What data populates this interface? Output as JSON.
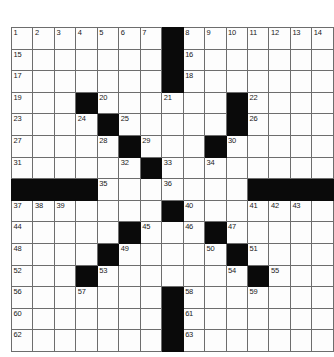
{
  "puzzle": {
    "type": "crossword-grid",
    "rows": 15,
    "cols": 15,
    "cell_fill_color": "#fdfdfd",
    "block_color": "#0a0a0a",
    "grid_line_color": "#6d6d6d",
    "number_color": "#1a1a1a",
    "max_clue_number": 63,
    "grid": [
      [
        {
          "n": "1",
          "b": false
        },
        {
          "n": "2",
          "b": false
        },
        {
          "n": "3",
          "b": false
        },
        {
          "n": "4",
          "b": false
        },
        {
          "n": "5",
          "b": false
        },
        {
          "n": "6",
          "b": false
        },
        {
          "n": "7",
          "b": false
        },
        {
          "n": "",
          "b": true
        },
        {
          "n": "8",
          "b": false
        },
        {
          "n": "9",
          "b": false
        },
        {
          "n": "10",
          "b": false
        },
        {
          "n": "11",
          "b": false
        },
        {
          "n": "12",
          "b": false
        },
        {
          "n": "13",
          "b": false
        },
        {
          "n": "14",
          "b": false
        }
      ],
      [
        {
          "n": "15",
          "b": false
        },
        {
          "n": "",
          "b": false
        },
        {
          "n": "",
          "b": false
        },
        {
          "n": "",
          "b": false
        },
        {
          "n": "",
          "b": false
        },
        {
          "n": "",
          "b": false
        },
        {
          "n": "",
          "b": false
        },
        {
          "n": "",
          "b": true
        },
        {
          "n": "16",
          "b": false
        },
        {
          "n": "",
          "b": false
        },
        {
          "n": "",
          "b": false
        },
        {
          "n": "",
          "b": false
        },
        {
          "n": "",
          "b": false
        },
        {
          "n": "",
          "b": false
        },
        {
          "n": "",
          "b": false
        }
      ],
      [
        {
          "n": "17",
          "b": false
        },
        {
          "n": "",
          "b": false
        },
        {
          "n": "",
          "b": false
        },
        {
          "n": "",
          "b": false
        },
        {
          "n": "",
          "b": false
        },
        {
          "n": "",
          "b": false
        },
        {
          "n": "",
          "b": false
        },
        {
          "n": "",
          "b": true
        },
        {
          "n": "18",
          "b": false
        },
        {
          "n": "",
          "b": false
        },
        {
          "n": "",
          "b": false
        },
        {
          "n": "",
          "b": false
        },
        {
          "n": "",
          "b": false
        },
        {
          "n": "",
          "b": false
        },
        {
          "n": "",
          "b": false
        }
      ],
      [
        {
          "n": "19",
          "b": false
        },
        {
          "n": "",
          "b": false
        },
        {
          "n": "",
          "b": false
        },
        {
          "n": "",
          "b": true
        },
        {
          "n": "20",
          "b": false
        },
        {
          "n": "",
          "b": false
        },
        {
          "n": "",
          "b": false
        },
        {
          "n": "21",
          "b": false
        },
        {
          "n": "",
          "b": false
        },
        {
          "n": "",
          "b": false
        },
        {
          "n": "",
          "b": true
        },
        {
          "n": "22",
          "b": false
        },
        {
          "n": "",
          "b": false
        },
        {
          "n": "",
          "b": false
        },
        {
          "n": "",
          "b": false
        }
      ],
      [
        {
          "n": "23",
          "b": false
        },
        {
          "n": "",
          "b": false
        },
        {
          "n": "",
          "b": false
        },
        {
          "n": "24",
          "b": false
        },
        {
          "n": "",
          "b": true
        },
        {
          "n": "25",
          "b": false
        },
        {
          "n": "",
          "b": false
        },
        {
          "n": "",
          "b": false
        },
        {
          "n": "",
          "b": false
        },
        {
          "n": "",
          "b": false
        },
        {
          "n": "",
          "b": true
        },
        {
          "n": "26",
          "b": false
        },
        {
          "n": "",
          "b": false
        },
        {
          "n": "",
          "b": false
        },
        {
          "n": "",
          "b": false
        }
      ],
      [
        {
          "n": "27",
          "b": false
        },
        {
          "n": "",
          "b": false
        },
        {
          "n": "",
          "b": false
        },
        {
          "n": "",
          "b": false
        },
        {
          "n": "28",
          "b": false
        },
        {
          "n": "",
          "b": true
        },
        {
          "n": "29",
          "b": false
        },
        {
          "n": "",
          "b": false
        },
        {
          "n": "",
          "b": false
        },
        {
          "n": "",
          "b": true
        },
        {
          "n": "30",
          "b": false
        },
        {
          "n": "",
          "b": false
        },
        {
          "n": "",
          "b": false
        },
        {
          "n": "",
          "b": false
        },
        {
          "n": "",
          "b": false
        }
      ],
      [
        {
          "n": "31",
          "b": false
        },
        {
          "n": "",
          "b": false
        },
        {
          "n": "",
          "b": false
        },
        {
          "n": "",
          "b": false
        },
        {
          "n": "",
          "b": false
        },
        {
          "n": "32",
          "b": false
        },
        {
          "n": "",
          "b": true
        },
        {
          "n": "33",
          "b": false
        },
        {
          "n": "",
          "b": false
        },
        {
          "n": "34",
          "b": false
        },
        {
          "n": "",
          "b": false
        },
        {
          "n": "",
          "b": false
        },
        {
          "n": "",
          "b": false
        },
        {
          "n": "",
          "b": false
        },
        {
          "n": "",
          "b": false
        }
      ],
      [
        {
          "n": "",
          "b": true
        },
        {
          "n": "",
          "b": true
        },
        {
          "n": "",
          "b": true
        },
        {
          "n": "",
          "b": true
        },
        {
          "n": "35",
          "b": false
        },
        {
          "n": "",
          "b": false
        },
        {
          "n": "",
          "b": false
        },
        {
          "n": "36",
          "b": false
        },
        {
          "n": "",
          "b": false
        },
        {
          "n": "",
          "b": false
        },
        {
          "n": "",
          "b": false
        },
        {
          "n": "",
          "b": true
        },
        {
          "n": "",
          "b": true
        },
        {
          "n": "",
          "b": true
        },
        {
          "n": "",
          "b": true
        }
      ],
      [
        {
          "n": "37",
          "b": false
        },
        {
          "n": "38",
          "b": false
        },
        {
          "n": "39",
          "b": false
        },
        {
          "n": "",
          "b": false
        },
        {
          "n": "",
          "b": false
        },
        {
          "n": "",
          "b": false
        },
        {
          "n": "",
          "b": false
        },
        {
          "n": "",
          "b": true
        },
        {
          "n": "40",
          "b": false
        },
        {
          "n": "",
          "b": false
        },
        {
          "n": "",
          "b": false
        },
        {
          "n": "41",
          "b": false
        },
        {
          "n": "42",
          "b": false
        },
        {
          "n": "43",
          "b": false
        },
        {
          "n": "",
          "b": false
        }
      ],
      [
        {
          "n": "44",
          "b": false
        },
        {
          "n": "",
          "b": false
        },
        {
          "n": "",
          "b": false
        },
        {
          "n": "",
          "b": false
        },
        {
          "n": "",
          "b": false
        },
        {
          "n": "",
          "b": true
        },
        {
          "n": "45",
          "b": false
        },
        {
          "n": "",
          "b": false
        },
        {
          "n": "46",
          "b": false
        },
        {
          "n": "",
          "b": true
        },
        {
          "n": "47",
          "b": false
        },
        {
          "n": "",
          "b": false
        },
        {
          "n": "",
          "b": false
        },
        {
          "n": "",
          "b": false
        },
        {
          "n": "",
          "b": false
        }
      ],
      [
        {
          "n": "48",
          "b": false
        },
        {
          "n": "",
          "b": false
        },
        {
          "n": "",
          "b": false
        },
        {
          "n": "",
          "b": false
        },
        {
          "n": "",
          "b": true
        },
        {
          "n": "49",
          "b": false
        },
        {
          "n": "",
          "b": false
        },
        {
          "n": "",
          "b": false
        },
        {
          "n": "",
          "b": false
        },
        {
          "n": "50",
          "b": false
        },
        {
          "n": "",
          "b": true
        },
        {
          "n": "51",
          "b": false
        },
        {
          "n": "",
          "b": false
        },
        {
          "n": "",
          "b": false
        },
        {
          "n": "",
          "b": false
        }
      ],
      [
        {
          "n": "52",
          "b": false
        },
        {
          "n": "",
          "b": false
        },
        {
          "n": "",
          "b": false
        },
        {
          "n": "",
          "b": true
        },
        {
          "n": "53",
          "b": false
        },
        {
          "n": "",
          "b": false
        },
        {
          "n": "",
          "b": false
        },
        {
          "n": "",
          "b": false
        },
        {
          "n": "",
          "b": false
        },
        {
          "n": "",
          "b": false
        },
        {
          "n": "54",
          "b": false
        },
        {
          "n": "",
          "b": true
        },
        {
          "n": "55",
          "b": false
        },
        {
          "n": "",
          "b": false
        },
        {
          "n": "",
          "b": false
        }
      ],
      [
        {
          "n": "56",
          "b": false
        },
        {
          "n": "",
          "b": false
        },
        {
          "n": "",
          "b": false
        },
        {
          "n": "57",
          "b": false
        },
        {
          "n": "",
          "b": false
        },
        {
          "n": "",
          "b": false
        },
        {
          "n": "",
          "b": false
        },
        {
          "n": "",
          "b": true
        },
        {
          "n": "58",
          "b": false
        },
        {
          "n": "",
          "b": false
        },
        {
          "n": "",
          "b": false
        },
        {
          "n": "59",
          "b": false
        },
        {
          "n": "",
          "b": false
        },
        {
          "n": "",
          "b": false
        },
        {
          "n": "",
          "b": false
        }
      ],
      [
        {
          "n": "60",
          "b": false
        },
        {
          "n": "",
          "b": false
        },
        {
          "n": "",
          "b": false
        },
        {
          "n": "",
          "b": false
        },
        {
          "n": "",
          "b": false
        },
        {
          "n": "",
          "b": false
        },
        {
          "n": "",
          "b": false
        },
        {
          "n": "",
          "b": true
        },
        {
          "n": "61",
          "b": false
        },
        {
          "n": "",
          "b": false
        },
        {
          "n": "",
          "b": false
        },
        {
          "n": "",
          "b": false
        },
        {
          "n": "",
          "b": false
        },
        {
          "n": "",
          "b": false
        },
        {
          "n": "",
          "b": false
        }
      ],
      [
        {
          "n": "62",
          "b": false
        },
        {
          "n": "",
          "b": false
        },
        {
          "n": "",
          "b": false
        },
        {
          "n": "",
          "b": false
        },
        {
          "n": "",
          "b": false
        },
        {
          "n": "",
          "b": false
        },
        {
          "n": "",
          "b": false
        },
        {
          "n": "",
          "b": true
        },
        {
          "n": "63",
          "b": false
        },
        {
          "n": "",
          "b": false
        },
        {
          "n": "",
          "b": false
        },
        {
          "n": "",
          "b": false
        },
        {
          "n": "",
          "b": false
        },
        {
          "n": "",
          "b": false
        },
        {
          "n": "",
          "b": false
        }
      ]
    ]
  }
}
